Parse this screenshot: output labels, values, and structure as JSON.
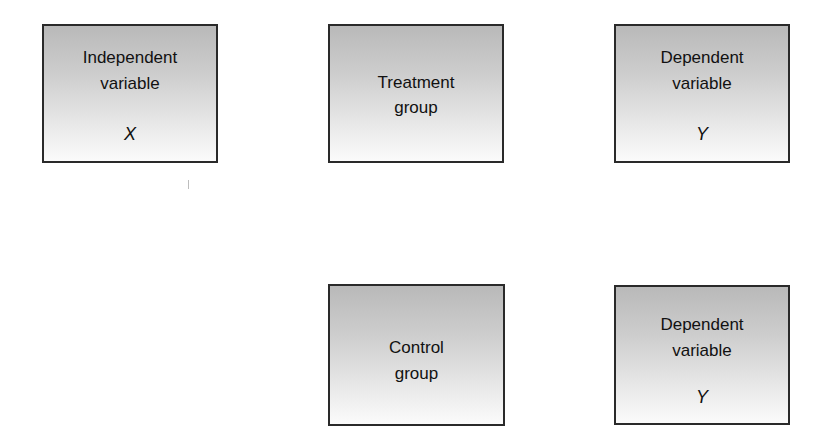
{
  "diagram": {
    "type": "experimental-design",
    "layout": "2 rows x 3 columns (top row full, bottom row columns 2-3)",
    "box_fill_gradient": {
      "top": "#b9b9b9",
      "bottom": "#fbfbfb"
    },
    "box_border_color": "#2a2a2a",
    "nodes": [
      {
        "id": "independent-variable",
        "lines": [
          "Independent",
          "variable"
        ],
        "symbol": "X",
        "row": 1,
        "col": 1
      },
      {
        "id": "treatment-group",
        "lines": [
          "Treatment",
          "group"
        ],
        "symbol": "",
        "row": 1,
        "col": 2
      },
      {
        "id": "dependent-variable-treatment",
        "lines": [
          "Dependent",
          "variable"
        ],
        "symbol": "Y",
        "row": 1,
        "col": 3
      },
      {
        "id": "control-group",
        "lines": [
          "Control",
          "group"
        ],
        "symbol": "",
        "row": 2,
        "col": 2
      },
      {
        "id": "dependent-variable-control",
        "lines": [
          "Dependent",
          "variable"
        ],
        "symbol": "Y",
        "row": 2,
        "col": 3
      }
    ]
  }
}
